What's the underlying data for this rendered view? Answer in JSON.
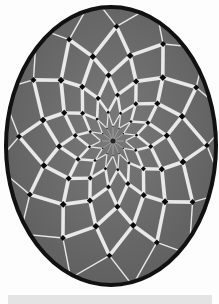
{
  "image": {
    "subject": "decorative egg with geometric rosette lattice pattern",
    "background_color": "#fdfdfd",
    "egg": {
      "cx": 111,
      "cy": 146,
      "rx": 105,
      "ry": 139,
      "rim_color": "#111111",
      "rim_width": 4,
      "fill_color": "#6a6a6a",
      "fill_highlight": "#7c7c7c"
    },
    "rosette": {
      "center_x": 113,
      "center_y": 141,
      "spokes": 12,
      "rings": 7,
      "ring_radii": [
        12,
        24,
        38,
        54,
        72,
        94,
        120
      ],
      "stretch_y": 1.22,
      "bar_color": "#e9e9e9",
      "bar_widths": [
        0.6,
        1.2,
        2.6,
        3.4,
        3.8,
        3.6,
        1.4
      ],
      "node_color": "#0a0a0a",
      "node_sizes": [
        1.2,
        2.4,
        3.6,
        4.4,
        4.8,
        4.2,
        2.4
      ],
      "center_dot_color": "#222222"
    },
    "caption_bar": {
      "color": "#e4e4e4",
      "text": ""
    }
  }
}
